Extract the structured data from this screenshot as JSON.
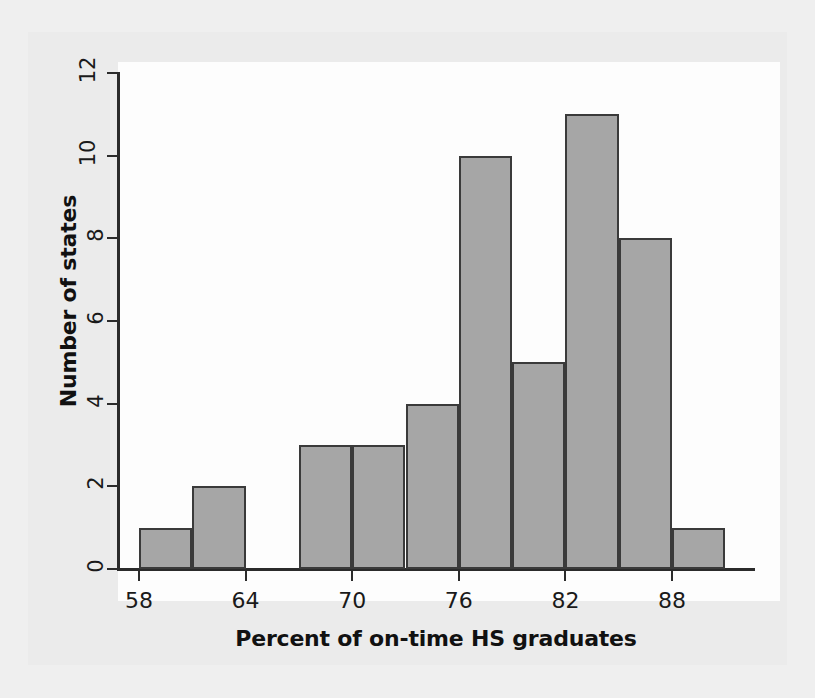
{
  "chart_data": {
    "type": "bar",
    "title": "",
    "subtitle": "",
    "xlabel": "Percent of on-time HS graduates",
    "ylabel": "Number of states",
    "xlim": [
      56.5,
      92.5
    ],
    "ylim": [
      0,
      12.4
    ],
    "grid": false,
    "legend": null,
    "bin_width": 3,
    "xticks": [
      58,
      64,
      70,
      76,
      82,
      88
    ],
    "xtick_labels": [
      "58",
      "64",
      "70",
      "76",
      "82",
      "88"
    ],
    "yticks": [
      0,
      2,
      4,
      6,
      8,
      10,
      12
    ],
    "ytick_labels": [
      "0",
      "2",
      "4",
      "6",
      "8",
      "10",
      "12"
    ],
    "categories": [
      "58-61",
      "61-64",
      "64-67",
      "67-70",
      "70-73",
      "73-76",
      "76-79",
      "79-82",
      "82-85",
      "85-88",
      "88-91"
    ],
    "bin_starts": [
      58,
      61,
      64,
      67,
      70,
      73,
      76,
      79,
      82,
      85,
      88
    ],
    "bin_ends": [
      61,
      64,
      67,
      70,
      73,
      76,
      79,
      82,
      85,
      88,
      91
    ],
    "values": [
      1,
      2,
      0,
      3,
      3,
      4,
      10,
      5,
      11,
      8,
      1
    ],
    "bar_fill_color": "#a6a6a6",
    "bar_edge_color": "#3a3a3a",
    "axis_color": "#2b2b2b",
    "plot_background": "#fdfdfd",
    "figure_background": "#ebebeb",
    "page_background": "#efefef"
  }
}
